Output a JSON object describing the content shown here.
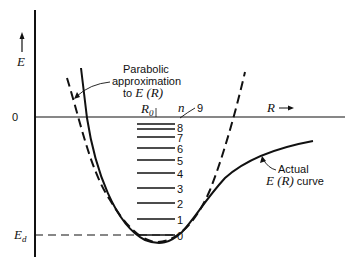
{
  "axes": {
    "y_label": "E",
    "x_label": "R",
    "zero_label": "0",
    "ed_label": "E",
    "ed_subscript": "d"
  },
  "annotations": {
    "parabolic_line1": "Parabolic",
    "parabolic_line2": "approximation",
    "parabolic_line3_prefix": "to ",
    "parabolic_line3_math": "E (R)",
    "actual_line1": "Actual",
    "actual_line2_math": "E (R)",
    "actual_line2_suffix": " curve",
    "r0_label": "R",
    "r0_subscript": "0",
    "n_label": "n"
  },
  "levels": [
    "0",
    "1",
    "2",
    "3",
    "4",
    "5",
    "6",
    "7",
    "8",
    "9"
  ],
  "colors": {
    "ink": "#111111",
    "background": "#ffffff"
  }
}
